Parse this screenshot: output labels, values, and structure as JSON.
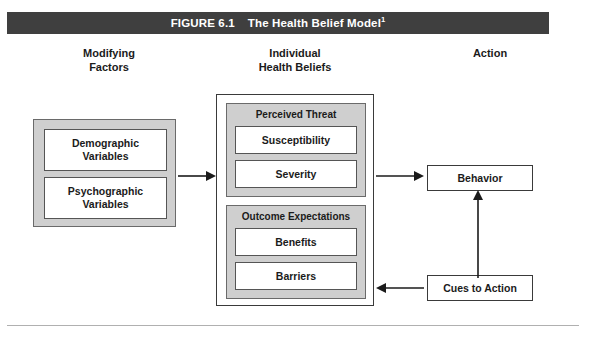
{
  "figure": {
    "number_label": "FIGURE 6.1",
    "title": "The Health Belief Model",
    "footnote_marker": "1",
    "title_bar_color": "#3f3f3f",
    "group_fill_color": "#cfcfcf",
    "box_fill_color": "#ffffff"
  },
  "columns": [
    {
      "id": "modifying",
      "heading": "Modifying\nFactors"
    },
    {
      "id": "individual",
      "heading": "Individual\nHealth Beliefs"
    },
    {
      "id": "action",
      "heading": "Action"
    }
  ],
  "modifying_factors": {
    "boxes": [
      {
        "label": "Demographic\nVariables"
      },
      {
        "label": "Psychographic\nVariables"
      }
    ]
  },
  "individual_health_beliefs": {
    "groups": [
      {
        "title": "Perceived Threat",
        "items": [
          {
            "label": "Susceptibility"
          },
          {
            "label": "Severity"
          }
        ]
      },
      {
        "title": "Outcome Expectations",
        "items": [
          {
            "label": "Benefits"
          },
          {
            "label": "Barriers"
          }
        ]
      }
    ]
  },
  "action": {
    "boxes": [
      {
        "id": "behavior",
        "label": "Behavior"
      },
      {
        "id": "cues",
        "label": "Cues to Action"
      }
    ]
  },
  "arrows": [
    {
      "id": "modifying-to-beliefs",
      "direction": "right"
    },
    {
      "id": "beliefs-to-behavior",
      "direction": "right"
    },
    {
      "id": "cues-to-beliefs",
      "direction": "left"
    },
    {
      "id": "cues-to-behavior",
      "direction": "up"
    }
  ]
}
